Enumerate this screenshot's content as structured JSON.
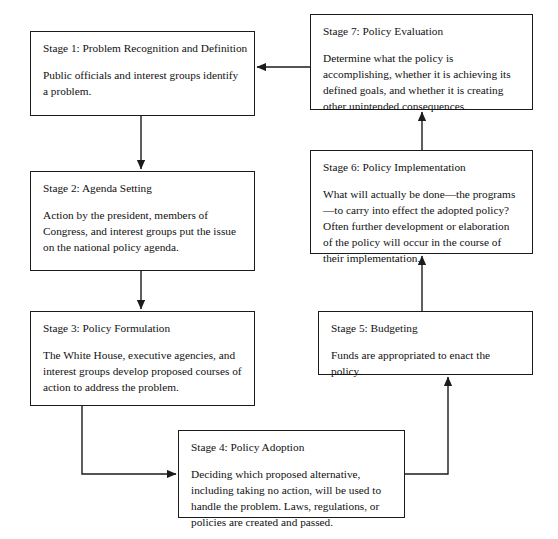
{
  "diagram": {
    "ink_color": "#1b1b1b",
    "background_color": "#ffffff",
    "stages": [
      {
        "id": "stage-1",
        "title": "Stage 1: Problem Recognition and Definition",
        "body": "Public officials and interest groups identify a problem."
      },
      {
        "id": "stage-2",
        "title": "Stage 2: Agenda Setting",
        "body": "Action by the president, members of Congress, and interest groups put the issue on the national policy agenda."
      },
      {
        "id": "stage-3",
        "title": "Stage 3: Policy Formulation",
        "body": "The White House, executive agencies, and interest groups develop proposed courses of action to address the problem."
      },
      {
        "id": "stage-4",
        "title": "Stage 4: Policy Adoption",
        "body": "Deciding which proposed alternative, including taking no action, will be used to handle the problem. Laws, regulations, or policies are created and passed."
      },
      {
        "id": "stage-5",
        "title": "Stage 5: Budgeting",
        "body": "Funds are appropriated to enact the policy."
      },
      {
        "id": "stage-6",
        "title": "Stage 6: Policy Implementation",
        "body": "What will actually be done—the programs—to carry into effect the adopted policy? Often further development or elaboration of the policy will occur in the course of their implementation."
      },
      {
        "id": "stage-7",
        "title": "Stage 7: Policy Evaluation",
        "body": "Determine what the policy is accomplishing, whether it is achieving its defined goals, and whether it is creating other unintended consequences."
      }
    ],
    "connectors": [
      {
        "id": "arrow-stage-1-to-2",
        "from": "stage-1",
        "to": "stage-2",
        "direction": "down"
      },
      {
        "id": "arrow-stage-2-to-3",
        "from": "stage-2",
        "to": "stage-3",
        "direction": "down"
      },
      {
        "id": "arrow-stage-3-to-4",
        "from": "stage-3",
        "to": "stage-4",
        "direction": "right"
      },
      {
        "id": "arrow-stage-4-to-5",
        "from": "stage-4",
        "to": "stage-5",
        "direction": "up"
      },
      {
        "id": "arrow-stage-5-to-6",
        "from": "stage-5",
        "to": "stage-6",
        "direction": "up"
      },
      {
        "id": "arrow-stage-6-to-7",
        "from": "stage-6",
        "to": "stage-7",
        "direction": "up"
      },
      {
        "id": "arrow-stage-7-to-1",
        "from": "stage-7",
        "to": "stage-1",
        "direction": "left"
      }
    ]
  }
}
